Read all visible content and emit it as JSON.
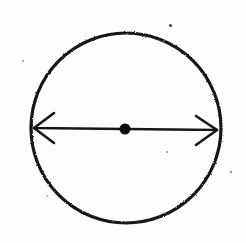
{
  "figure": {
    "kind": "hand-drawn-geometry-sketch",
    "background_color": "#fdfdfd",
    "ink_color": "#141414",
    "canvas": {
      "width": 246,
      "height": 243
    },
    "circle": {
      "label": "circle-outline",
      "center_x": 126,
      "center_y": 128,
      "radius_x": 95,
      "radius_y": 95,
      "stroke_width": 3.2,
      "stroke_color": "#151515",
      "fill": "none"
    },
    "center_point": {
      "label": "center-dot",
      "x": 125,
      "y": 129,
      "radius": 5.5,
      "fill_color": "#101010"
    },
    "diameter_arrow": {
      "label": "diameter-double-arrow",
      "start_x": 34,
      "start_y": 128,
      "end_x": 217,
      "end_y": 130,
      "stroke_width": 2.4,
      "stroke_color": "#151515",
      "arrowhead_length": 20,
      "arrowhead_half_height": 15,
      "heads": "both"
    },
    "specks": [
      {
        "name": "speck-top-right",
        "x": 170,
        "y": 25,
        "size": 3.0,
        "color": "#3b3b3b"
      },
      {
        "name": "speck-upper-left",
        "x": 23,
        "y": 61,
        "size": 2.4,
        "color": "#8d8d8d"
      },
      {
        "name": "speck-mid-right",
        "x": 167,
        "y": 152,
        "size": 2.2,
        "color": "#8d8d8d"
      },
      {
        "name": "speck-far-right",
        "x": 231,
        "y": 172,
        "size": 2.6,
        "color": "#6f6f6f"
      },
      {
        "name": "speck-lower-left",
        "x": 47,
        "y": 196,
        "size": 1.8,
        "color": "#b4b4b4"
      }
    ]
  }
}
